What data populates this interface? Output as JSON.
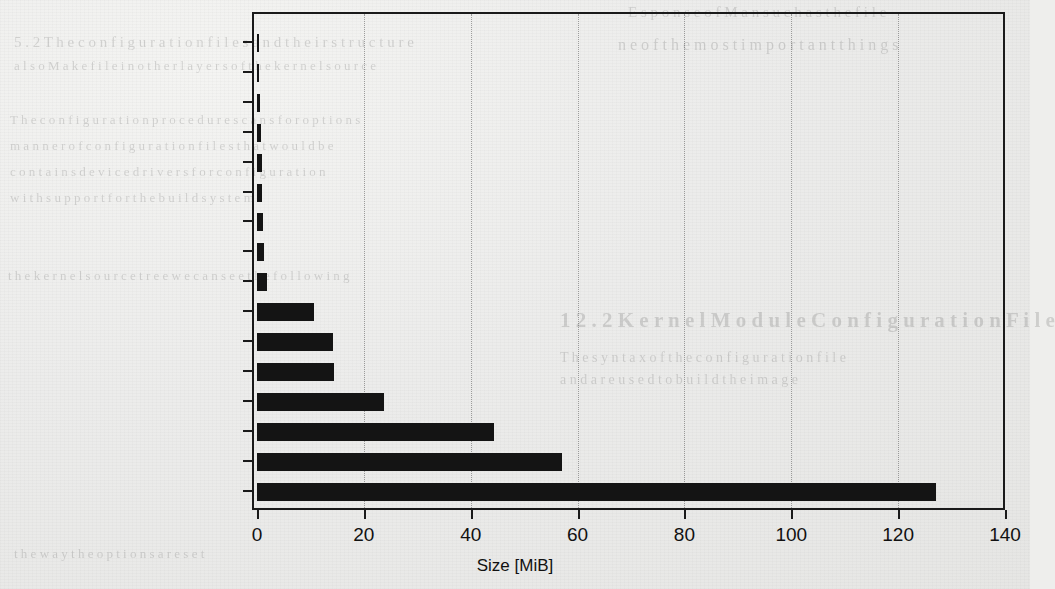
{
  "chart_data": {
    "type": "bar",
    "orientation": "horizontal",
    "title": "",
    "xlabel": "Size [MiB]",
    "ylabel": "",
    "xlim": [
      0,
      140
    ],
    "xticks": [
      0,
      20,
      40,
      60,
      80,
      100,
      120,
      140
    ],
    "xtick_labels": [
      "0",
      "20",
      "40",
      "60",
      "80",
      "100",
      "120",
      "140"
    ],
    "grid": "vertical-dotted",
    "legend": "none",
    "bar_color": "#141414",
    "categories": [
      "Initialization",
      "IPC",
      "Block Layer",
      "Security Framework",
      "Library Functions",
      "Cryptographic Routines",
      "Memory Management",
      "Scripts",
      "Core Kernel",
      "Documentation",
      "Sound Drivers",
      "Networking",
      "Filesystems",
      "Header Files",
      "Architecture-Specific Code",
      "Device Drivers"
    ],
    "values": [
      0.2,
      0.3,
      0.5,
      0.8,
      0.9,
      1.0,
      1.1,
      1.3,
      1.8,
      10.7,
      14.2,
      14.4,
      23.8,
      44.4,
      57.0,
      127.0
    ]
  },
  "ghost_text": {
    "note": "faint show-through text from reverse side of scanned page",
    "lines": [
      {
        "t": "E s p o n s e   o f   M a n   s u c h   a s   t h e   f i l e",
        "x": 628,
        "y": 4,
        "s": 15
      },
      {
        "t": "n e   o f   t h e   m o s t   i m p o r t a n t   t h i n g s",
        "x": 618,
        "y": 36,
        "s": 16
      },
      {
        "t": "5 . 2   T h e   c o n f i g u r a t i o n   f i l e s   a n d   t h e i r   s t r u c t u r e",
        "x": 14,
        "y": 34,
        "s": 15
      },
      {
        "t": "a l s o   M a k e f i l e   i n   o t h e r   l a y e r s   o f   t h e   k e r n e l   s o u r c e",
        "x": 14,
        "y": 58,
        "s": 13
      },
      {
        "t": "T h e   c o n f i g u r a t i o n   p r o c e d u r e   s c a n s   f o r   o p t i o n s",
        "x": 10,
        "y": 112,
        "s": 13
      },
      {
        "t": "m a n n e r   o f   c o n f i g u r a t i o n   f i l e s   t h a t   w o u l d   b e",
        "x": 10,
        "y": 138,
        "s": 13
      },
      {
        "t": "c o n t a i n s   d e v i c e   d r i v e r s   f o r   c o n f i g u r a t i o n",
        "x": 10,
        "y": 164,
        "s": 13
      },
      {
        "t": "w i t h   s u p p o r t   f o r   t h e   b u i l d   s y s t e m",
        "x": 10,
        "y": 190,
        "s": 13
      },
      {
        "t": "t h e   k e r n e l   s o u r c e   t r e e   w e   c a n   s e e   t h e   f o l l o w i n g",
        "x": 8,
        "y": 268,
        "s": 13
      },
      {
        "t": "1 2 . 2   K e r n e l   M o d u l e   C o n f i g u r a t i o n   F i l e",
        "x": 560,
        "y": 308,
        "s": 21,
        "bold": true
      },
      {
        "t": "T h e   s y n t a x   o f   t h e   c o n f i g u r a t i o n   f i l e",
        "x": 560,
        "y": 350,
        "s": 14
      },
      {
        "t": "a n d   a r e   u s e d   t o   b u i l d   t h e   i m a g e",
        "x": 560,
        "y": 372,
        "s": 14
      },
      {
        "t": "t h e   w a y   t h e   o p t i o n s   a r e   s e t",
        "x": 14,
        "y": 546,
        "s": 13
      }
    ]
  }
}
